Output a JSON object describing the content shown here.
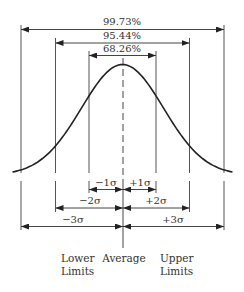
{
  "diagram": {
    "percentages": {
      "three_sigma": "99.73%",
      "two_sigma": "95.44%",
      "one_sigma": "68.26%"
    },
    "sigma_labels": {
      "minus_1": "−1σ",
      "plus_1": "+1σ",
      "minus_2": "−2σ",
      "plus_2": "+2σ",
      "minus_3": "−3σ",
      "plus_3": "+3σ"
    },
    "bottom_labels": {
      "lower_line1": "Lower",
      "lower_line2": "Limits",
      "average": "Average",
      "upper_line1": "Upper",
      "upper_line2": "Limits"
    },
    "curve": {
      "center_x": 122.5,
      "baseline_y": 175,
      "peak_y": 64.5,
      "spread_px": 41,
      "half_width_px": 110
    },
    "colors": {
      "curve": "#222222",
      "lines": "#555555",
      "text": "#333333"
    }
  }
}
